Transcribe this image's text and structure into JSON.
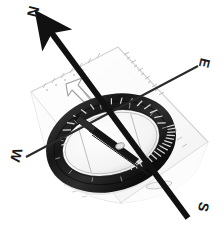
{
  "scene": {
    "title": "Baseplate compass with cardinal direction overlay",
    "background_color": "#ffffff",
    "width": 224,
    "height": 234
  },
  "compass": {
    "device_type": "baseplate orienteering compass",
    "bezel": {
      "name": "rotating-bezel-ring",
      "color_dark": "#1c1c1c",
      "color_mid": "#4a4a4a",
      "color_light": "#bdbdbd",
      "serration_count": 48,
      "center_x": 111,
      "center_y": 143,
      "radius_x": 58,
      "radius_y": 40,
      "rotation_deg": -16
    },
    "housing": {
      "name": "capsule-housing",
      "color": "#f2f2f2",
      "edge_color": "#c9c9c9"
    },
    "needle": {
      "name": "magnetic-needle",
      "color": "#151515",
      "pivot_color": "#dddddd"
    },
    "baseplate": {
      "name": "transparent-baseplate",
      "fill": "#fbfbfb",
      "stroke": "#d2d2d2",
      "orienting_arrow_stroke": "#9a9a9a",
      "ruler_tick_color": "#b8b8b8",
      "lanyard_slot": true
    }
  },
  "overlay": {
    "north_arrow": {
      "label": "N",
      "color": "#111111",
      "stroke_width": 6,
      "has_arrowhead": true,
      "from": {
        "x": 186,
        "y": 216
      },
      "to": {
        "x": 45,
        "y": 24
      }
    },
    "east_line": {
      "label": "E",
      "color": "#2a2a2a",
      "stroke_width": 2,
      "has_arrowhead": false,
      "from": {
        "x": 26,
        "y": 157
      },
      "to": {
        "x": 198,
        "y": 66
      }
    },
    "west_label": {
      "label": "W",
      "color": "#2a2a2a"
    },
    "south_label": {
      "label": "S",
      "color": "#2a2a2a"
    }
  },
  "labels": {
    "north": "N",
    "east": "E",
    "west": "W",
    "south": "S"
  }
}
